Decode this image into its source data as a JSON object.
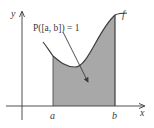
{
  "diagram": {
    "axes": {
      "x_label": "x",
      "y_label": "y"
    },
    "interval": {
      "left_label": "a",
      "right_label": "b"
    },
    "function_label": "f",
    "annotation": "P([a, b]) = 1",
    "colors": {
      "shade": "#a8a8a8",
      "line": "#3c3c3c",
      "background": "#ffffff"
    }
  }
}
